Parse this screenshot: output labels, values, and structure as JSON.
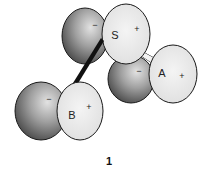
{
  "diagram": {
    "type": "orbital-interaction",
    "caption": "1",
    "orbitals": [
      {
        "id": "S",
        "label": "S",
        "negative_sign": "−",
        "positive_sign": "+",
        "dark_lobe": {
          "cx": 85,
          "cy": 36,
          "rx": 23,
          "ry": 28
        },
        "light_lobe": {
          "cx": 126,
          "cy": 34,
          "rx": 24,
          "ry": 30
        }
      },
      {
        "id": "A",
        "label": "A",
        "negative_sign": "−",
        "positive_sign": "+",
        "dark_lobe": {
          "cx": 131,
          "cy": 79,
          "rx": 23,
          "ry": 24
        },
        "light_lobe": {
          "cx": 173,
          "cy": 74,
          "rx": 24,
          "ry": 29
        }
      },
      {
        "id": "B",
        "label": "B",
        "negative_sign": "−",
        "positive_sign": "+",
        "dark_lobe": {
          "cx": 41,
          "cy": 111,
          "rx": 26,
          "ry": 29
        },
        "light_lobe": {
          "cx": 80,
          "cy": 111,
          "rx": 23,
          "ry": 29
        }
      }
    ],
    "bonds": [
      {
        "from": "S",
        "to": "B",
        "style": "thick"
      },
      {
        "from": "S",
        "to": "A",
        "style": "thin"
      }
    ],
    "colors": {
      "dark_lobe_light": "#d8d8d8",
      "dark_lobe_dark": "#4a4a4a",
      "light_lobe_fill": "#ececec",
      "outline": "#1a1a1a"
    }
  }
}
